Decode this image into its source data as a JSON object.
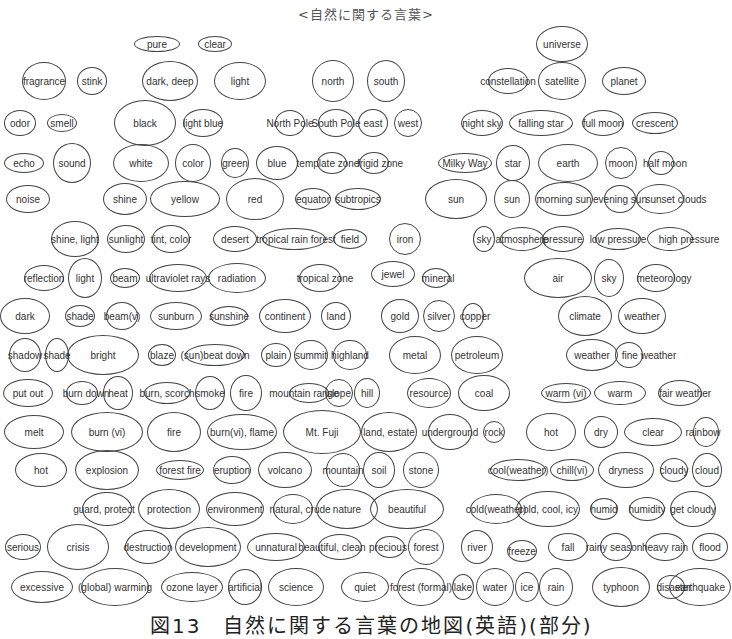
{
  "title": "<自然に関する言葉>",
  "caption": "図13　自然に関する言葉の地図(英語)(部分)",
  "nodes": [
    {
      "t": "pure",
      "x": 157,
      "y": 44,
      "w": 46,
      "h": 16
    },
    {
      "t": "clear",
      "x": 215,
      "y": 44,
      "w": 34,
      "h": 16
    },
    {
      "t": "universe",
      "x": 562,
      "y": 44,
      "w": 52,
      "h": 36
    },
    {
      "t": "fragrance",
      "x": 44,
      "y": 81,
      "w": 44,
      "h": 38
    },
    {
      "t": "stink",
      "x": 92,
      "y": 81,
      "w": 30,
      "h": 28
    },
    {
      "t": "dark, deep",
      "x": 170,
      "y": 81,
      "w": 56,
      "h": 40
    },
    {
      "t": "light",
      "x": 240,
      "y": 81,
      "w": 52,
      "h": 38
    },
    {
      "t": "north",
      "x": 333,
      "y": 81,
      "w": 42,
      "h": 42
    },
    {
      "t": "south",
      "x": 386,
      "y": 81,
      "w": 38,
      "h": 42
    },
    {
      "t": "constellation",
      "x": 508,
      "y": 81,
      "w": 40,
      "h": 26
    },
    {
      "t": "satellite",
      "x": 562,
      "y": 81,
      "w": 48,
      "h": 38
    },
    {
      "t": "planet",
      "x": 624,
      "y": 81,
      "w": 44,
      "h": 28
    },
    {
      "t": "odor",
      "x": 20,
      "y": 123,
      "w": 32,
      "h": 26
    },
    {
      "t": "smell",
      "x": 62,
      "y": 123,
      "w": 30,
      "h": 18
    },
    {
      "t": "black",
      "x": 145,
      "y": 123,
      "w": 62,
      "h": 46
    },
    {
      "t": "light blue",
      "x": 203,
      "y": 123,
      "w": 40,
      "h": 28
    },
    {
      "t": "North Pole",
      "x": 290,
      "y": 123,
      "w": 30,
      "h": 26
    },
    {
      "t": "South Pole",
      "x": 336,
      "y": 123,
      "w": 36,
      "h": 28
    },
    {
      "t": "east",
      "x": 373,
      "y": 123,
      "w": 30,
      "h": 28
    },
    {
      "t": "west",
      "x": 408,
      "y": 123,
      "w": 28,
      "h": 28
    },
    {
      "t": "night sky",
      "x": 482,
      "y": 123,
      "w": 42,
      "h": 26
    },
    {
      "t": "falling star",
      "x": 541,
      "y": 123,
      "w": 64,
      "h": 26
    },
    {
      "t": "full moon",
      "x": 603,
      "y": 123,
      "w": 42,
      "h": 26
    },
    {
      "t": "crescent",
      "x": 655,
      "y": 123,
      "w": 46,
      "h": 22
    },
    {
      "t": "echo",
      "x": 24,
      "y": 163,
      "w": 40,
      "h": 20
    },
    {
      "t": "sound",
      "x": 72,
      "y": 163,
      "w": 38,
      "h": 40
    },
    {
      "t": "white",
      "x": 141,
      "y": 163,
      "w": 56,
      "h": 38
    },
    {
      "t": "color",
      "x": 193,
      "y": 163,
      "w": 36,
      "h": 38
    },
    {
      "t": "green",
      "x": 235,
      "y": 163,
      "w": 28,
      "h": 30
    },
    {
      "t": "blue",
      "x": 277,
      "y": 163,
      "w": 42,
      "h": 34
    },
    {
      "t": "template zone",
      "x": 332,
      "y": 163,
      "w": 30,
      "h": 22,
      "lbl": [
        328,
        163
      ]
    },
    {
      "t": "frigid zone",
      "x": 374,
      "y": 163,
      "w": 30,
      "h": 22,
      "lbl": [
        380,
        163
      ]
    },
    {
      "t": "Milky Way",
      "x": 465,
      "y": 163,
      "w": 54,
      "h": 20
    },
    {
      "t": "star",
      "x": 513,
      "y": 163,
      "w": 34,
      "h": 36
    },
    {
      "t": "earth",
      "x": 568,
      "y": 163,
      "w": 60,
      "h": 38
    },
    {
      "t": "moon",
      "x": 621,
      "y": 163,
      "w": 32,
      "h": 32
    },
    {
      "t": "half moon",
      "x": 661,
      "y": 163,
      "w": 26,
      "h": 24,
      "lbl": [
        665,
        163
      ]
    },
    {
      "t": "noise",
      "x": 28,
      "y": 199,
      "w": 44,
      "h": 28
    },
    {
      "t": "shine",
      "x": 125,
      "y": 199,
      "w": 44,
      "h": 32
    },
    {
      "t": "yellow",
      "x": 185,
      "y": 199,
      "w": 70,
      "h": 36
    },
    {
      "t": "red",
      "x": 255,
      "y": 199,
      "w": 58,
      "h": 42
    },
    {
      "t": "equator",
      "x": 313,
      "y": 199,
      "w": 36,
      "h": 22
    },
    {
      "t": "subtropics",
      "x": 358,
      "y": 199,
      "w": 46,
      "h": 22
    },
    {
      "t": "sun",
      "x": 456,
      "y": 199,
      "w": 62,
      "h": 40
    },
    {
      "t": "sun",
      "x": 512,
      "y": 199,
      "w": 36,
      "h": 38
    },
    {
      "t": "morning sun",
      "x": 564,
      "y": 199,
      "w": 58,
      "h": 34
    },
    {
      "t": "evening sun",
      "x": 620,
      "y": 199,
      "w": 32,
      "h": 28,
      "lbl": [
        620,
        199
      ]
    },
    {
      "t": "sunset clouds",
      "x": 660,
      "y": 199,
      "w": 48,
      "h": 30,
      "lbl": [
        676,
        199
      ]
    },
    {
      "t": "shine, light",
      "x": 75,
      "y": 239,
      "w": 48,
      "h": 36
    },
    {
      "t": "sunlight",
      "x": 126,
      "y": 239,
      "w": 38,
      "h": 28
    },
    {
      "t": "tint, color",
      "x": 171,
      "y": 239,
      "w": 38,
      "h": 28
    },
    {
      "t": "desert",
      "x": 235,
      "y": 239,
      "w": 44,
      "h": 26
    },
    {
      "t": "tropical rain forest",
      "x": 294,
      "y": 239,
      "w": 64,
      "h": 22,
      "lbl": [
        296,
        239
      ]
    },
    {
      "t": "field",
      "x": 350,
      "y": 239,
      "w": 34,
      "h": 20
    },
    {
      "t": "iron",
      "x": 405,
      "y": 239,
      "w": 32,
      "h": 32
    },
    {
      "t": "sky",
      "x": 484,
      "y": 239,
      "w": 22,
      "h": 26
    },
    {
      "t": "atmosphere",
      "x": 522,
      "y": 239,
      "w": 44,
      "h": 24
    },
    {
      "t": "pressure",
      "x": 563,
      "y": 239,
      "w": 42,
      "h": 26
    },
    {
      "t": "low pressure",
      "x": 618,
      "y": 239,
      "w": 46,
      "h": 22
    },
    {
      "t": "high pressure",
      "x": 670,
      "y": 239,
      "w": 46,
      "h": 24,
      "lbl": [
        689,
        239
      ]
    },
    {
      "t": "reflection",
      "x": 44,
      "y": 278,
      "w": 40,
      "h": 26
    },
    {
      "t": "light",
      "x": 85,
      "y": 278,
      "w": 34,
      "h": 40
    },
    {
      "t": "beam",
      "x": 125,
      "y": 278,
      "w": 30,
      "h": 20
    },
    {
      "t": "ultraviolet rays",
      "x": 178,
      "y": 278,
      "w": 58,
      "h": 28,
      "lbl": [
        178,
        278
      ]
    },
    {
      "t": "radiation",
      "x": 237,
      "y": 278,
      "w": 58,
      "h": 30
    },
    {
      "t": "tropical zone",
      "x": 320,
      "y": 278,
      "w": 42,
      "h": 28,
      "lbl": [
        325,
        278
      ]
    },
    {
      "t": "jewel",
      "x": 393,
      "y": 274,
      "w": 44,
      "h": 26
    },
    {
      "t": "mineral",
      "x": 436,
      "y": 278,
      "w": 28,
      "h": 20,
      "lbl": [
        438,
        278
      ]
    },
    {
      "t": "air",
      "x": 558,
      "y": 278,
      "w": 68,
      "h": 40
    },
    {
      "t": "sky",
      "x": 609,
      "y": 278,
      "w": 30,
      "h": 38
    },
    {
      "t": "meteorology",
      "x": 656,
      "y": 278,
      "w": 38,
      "h": 28,
      "lbl": [
        664,
        278
      ]
    },
    {
      "t": "dark",
      "x": 25,
      "y": 316,
      "w": 50,
      "h": 36
    },
    {
      "t": "shade",
      "x": 80,
      "y": 316,
      "w": 30,
      "h": 22
    },
    {
      "t": "beam(v)",
      "x": 122,
      "y": 316,
      "w": 32,
      "h": 28
    },
    {
      "t": "sunburn",
      "x": 176,
      "y": 316,
      "w": 52,
      "h": 28
    },
    {
      "t": "sunshine",
      "x": 229,
      "y": 316,
      "w": 38,
      "h": 20
    },
    {
      "t": "continent",
      "x": 285,
      "y": 316,
      "w": 52,
      "h": 34
    },
    {
      "t": "land",
      "x": 336,
      "y": 316,
      "w": 30,
      "h": 28
    },
    {
      "t": "gold",
      "x": 400,
      "y": 316,
      "w": 38,
      "h": 34
    },
    {
      "t": "silver",
      "x": 439,
      "y": 316,
      "w": 32,
      "h": 32
    },
    {
      "t": "copper",
      "x": 473,
      "y": 316,
      "w": 22,
      "h": 26,
      "lbl": [
        475,
        316
      ]
    },
    {
      "t": "climate",
      "x": 585,
      "y": 316,
      "w": 54,
      "h": 40
    },
    {
      "t": "weather",
      "x": 642,
      "y": 316,
      "w": 48,
      "h": 36
    },
    {
      "t": "shadow",
      "x": 25,
      "y": 355,
      "w": 32,
      "h": 34
    },
    {
      "t": "shade",
      "x": 57,
      "y": 355,
      "w": 24,
      "h": 34
    },
    {
      "t": "bright",
      "x": 103,
      "y": 355,
      "w": 72,
      "h": 40
    },
    {
      "t": "blaze",
      "x": 162,
      "y": 355,
      "w": 28,
      "h": 22
    },
    {
      "t": "(sun)beat down",
      "x": 215,
      "y": 355,
      "w": 60,
      "h": 22
    },
    {
      "t": "plain",
      "x": 276,
      "y": 355,
      "w": 30,
      "h": 24
    },
    {
      "t": "summit",
      "x": 311,
      "y": 355,
      "w": 34,
      "h": 30
    },
    {
      "t": "highland",
      "x": 350,
      "y": 355,
      "w": 34,
      "h": 30
    },
    {
      "t": "metal",
      "x": 415,
      "y": 355,
      "w": 52,
      "h": 38
    },
    {
      "t": "petroleum",
      "x": 477,
      "y": 355,
      "w": 52,
      "h": 38
    },
    {
      "t": "weather",
      "x": 592,
      "y": 355,
      "w": 52,
      "h": 32
    },
    {
      "t": "fine weather",
      "x": 629,
      "y": 355,
      "w": 28,
      "h": 26,
      "lbl": [
        649,
        355
      ]
    },
    {
      "t": "put out",
      "x": 28,
      "y": 393,
      "w": 50,
      "h": 28
    },
    {
      "t": "burn down",
      "x": 82,
      "y": 393,
      "w": 32,
      "h": 24,
      "lbl": [
        86,
        393
      ]
    },
    {
      "t": "heat",
      "x": 118,
      "y": 393,
      "w": 30,
      "h": 34
    },
    {
      "t": "burn, scorch",
      "x": 167,
      "y": 393,
      "w": 46,
      "h": 22
    },
    {
      "t": "smoke",
      "x": 210,
      "y": 393,
      "w": 30,
      "h": 34
    },
    {
      "t": "fire",
      "x": 246,
      "y": 393,
      "w": 32,
      "h": 36
    },
    {
      "t": "mountain range",
      "x": 309,
      "y": 393,
      "w": 40,
      "h": 20,
      "lbl": [
        304,
        393
      ]
    },
    {
      "t": "slope",
      "x": 339,
      "y": 393,
      "w": 28,
      "h": 28
    },
    {
      "t": "hill",
      "x": 367,
      "y": 393,
      "w": 26,
      "h": 30
    },
    {
      "t": "resource",
      "x": 429,
      "y": 393,
      "w": 44,
      "h": 30
    },
    {
      "t": "coal",
      "x": 484,
      "y": 393,
      "w": 52,
      "h": 36
    },
    {
      "t": "warm (vi)",
      "x": 566,
      "y": 393,
      "w": 50,
      "h": 20
    },
    {
      "t": "warm",
      "x": 620,
      "y": 393,
      "w": 52,
      "h": 24
    },
    {
      "t": "fair weather",
      "x": 680,
      "y": 393,
      "w": 44,
      "h": 26,
      "lbl": [
        685,
        393
      ]
    },
    {
      "t": "melt",
      "x": 34,
      "y": 432,
      "w": 60,
      "h": 34
    },
    {
      "t": "burn (vi)",
      "x": 107,
      "y": 432,
      "w": 72,
      "h": 40
    },
    {
      "t": "fire",
      "x": 174,
      "y": 432,
      "w": 54,
      "h": 40
    },
    {
      "t": "burn(vi), flame",
      "x": 242,
      "y": 432,
      "w": 70,
      "h": 36
    },
    {
      "t": "Mt. Fuji",
      "x": 322,
      "y": 432,
      "w": 78,
      "h": 44
    },
    {
      "t": "land, estate",
      "x": 389,
      "y": 432,
      "w": 56,
      "h": 40
    },
    {
      "t": "underground",
      "x": 450,
      "y": 432,
      "w": 44,
      "h": 36
    },
    {
      "t": "rock",
      "x": 494,
      "y": 432,
      "w": 22,
      "h": 22
    },
    {
      "t": "hot",
      "x": 551,
      "y": 432,
      "w": 50,
      "h": 38
    },
    {
      "t": "dry",
      "x": 601,
      "y": 432,
      "w": 34,
      "h": 32
    },
    {
      "t": "clear",
      "x": 653,
      "y": 432,
      "w": 58,
      "h": 28
    },
    {
      "t": "rainbow",
      "x": 706,
      "y": 432,
      "w": 26,
      "h": 30,
      "lbl": [
        703,
        432
      ]
    },
    {
      "t": "hot",
      "x": 41,
      "y": 470,
      "w": 52,
      "h": 34
    },
    {
      "t": "explosion",
      "x": 107,
      "y": 470,
      "w": 64,
      "h": 40
    },
    {
      "t": "forest fire",
      "x": 180,
      "y": 470,
      "w": 48,
      "h": 20
    },
    {
      "t": "eruption",
      "x": 232,
      "y": 470,
      "w": 38,
      "h": 28
    },
    {
      "t": "volcano",
      "x": 285,
      "y": 470,
      "w": 54,
      "h": 36
    },
    {
      "t": "mountain",
      "x": 343,
      "y": 470,
      "w": 34,
      "h": 34
    },
    {
      "t": "soil",
      "x": 379,
      "y": 470,
      "w": 32,
      "h": 36
    },
    {
      "t": "stone",
      "x": 421,
      "y": 470,
      "w": 36,
      "h": 36
    },
    {
      "t": "cool(weather)",
      "x": 518,
      "y": 470,
      "w": 56,
      "h": 22
    },
    {
      "t": "chill(vi)",
      "x": 572,
      "y": 470,
      "w": 44,
      "h": 22
    },
    {
      "t": "dryness",
      "x": 626,
      "y": 470,
      "w": 56,
      "h": 36
    },
    {
      "t": "cloudy",
      "x": 674,
      "y": 470,
      "w": 28,
      "h": 24
    },
    {
      "t": "cloud",
      "x": 707,
      "y": 470,
      "w": 30,
      "h": 34
    },
    {
      "t": "guard, protect",
      "x": 107,
      "y": 509,
      "w": 50,
      "h": 34,
      "lbl": [
        104,
        509
      ]
    },
    {
      "t": "protection",
      "x": 169,
      "y": 509,
      "w": 62,
      "h": 40
    },
    {
      "t": "environment",
      "x": 235,
      "y": 509,
      "w": 58,
      "h": 34
    },
    {
      "t": "natural, crude",
      "x": 293,
      "y": 509,
      "w": 40,
      "h": 30,
      "lbl": [
        300,
        509
      ]
    },
    {
      "t": "nature",
      "x": 347,
      "y": 509,
      "w": 62,
      "h": 40
    },
    {
      "t": "beautiful",
      "x": 407,
      "y": 509,
      "w": 74,
      "h": 40
    },
    {
      "t": "cold(weather)",
      "x": 496,
      "y": 509,
      "w": 52,
      "h": 30
    },
    {
      "t": "cold, cool, icy",
      "x": 548,
      "y": 509,
      "w": 64,
      "h": 36
    },
    {
      "t": "humid",
      "x": 604,
      "y": 509,
      "w": 28,
      "h": 22
    },
    {
      "t": "humidity",
      "x": 647,
      "y": 509,
      "w": 36,
      "h": 24
    },
    {
      "t": "get cloudy",
      "x": 693,
      "y": 509,
      "w": 46,
      "h": 36
    },
    {
      "t": "serious",
      "x": 23,
      "y": 547,
      "w": 36,
      "h": 26
    },
    {
      "t": "crisis",
      "x": 78,
      "y": 547,
      "w": 62,
      "h": 46
    },
    {
      "t": "destruction",
      "x": 148,
      "y": 547,
      "w": 46,
      "h": 34
    },
    {
      "t": "development",
      "x": 208,
      "y": 547,
      "w": 66,
      "h": 40
    },
    {
      "t": "unnatural",
      "x": 276,
      "y": 547,
      "w": 58,
      "h": 28
    },
    {
      "t": "beautiful, clean",
      "x": 340,
      "y": 547,
      "w": 44,
      "h": 26,
      "lbl": [
        332,
        547
      ]
    },
    {
      "t": "precious",
      "x": 390,
      "y": 547,
      "w": 30,
      "h": 22,
      "lbl": [
        388,
        547
      ]
    },
    {
      "t": "forest",
      "x": 426,
      "y": 547,
      "w": 36,
      "h": 36
    },
    {
      "t": "river",
      "x": 477,
      "y": 547,
      "w": 32,
      "h": 34
    },
    {
      "t": "freeze",
      "x": 522,
      "y": 551,
      "w": 30,
      "h": 22
    },
    {
      "t": "fall",
      "x": 568,
      "y": 547,
      "w": 40,
      "h": 28
    },
    {
      "t": "rainy season",
      "x": 616,
      "y": 547,
      "w": 32,
      "h": 28,
      "lbl": [
        614,
        547
      ]
    },
    {
      "t": "heavy rain",
      "x": 665,
      "y": 547,
      "w": 40,
      "h": 28
    },
    {
      "t": "flood",
      "x": 710,
      "y": 547,
      "w": 36,
      "h": 28
    },
    {
      "t": "excessive",
      "x": 42,
      "y": 587,
      "w": 62,
      "h": 32
    },
    {
      "t": "(global) warming",
      "x": 115,
      "y": 587,
      "w": 68,
      "h": 38
    },
    {
      "t": "ozone layer",
      "x": 192,
      "y": 587,
      "w": 62,
      "h": 30
    },
    {
      "t": "artificial",
      "x": 245,
      "y": 587,
      "w": 34,
      "h": 36
    },
    {
      "t": "science",
      "x": 296,
      "y": 587,
      "w": 56,
      "h": 38
    },
    {
      "t": "quiet",
      "x": 365,
      "y": 587,
      "w": 48,
      "h": 30
    },
    {
      "t": "forest (formal)",
      "x": 421,
      "y": 587,
      "w": 48,
      "h": 38
    },
    {
      "t": "lake",
      "x": 463,
      "y": 587,
      "w": 22,
      "h": 26
    },
    {
      "t": "water",
      "x": 495,
      "y": 587,
      "w": 38,
      "h": 38
    },
    {
      "t": "ice",
      "x": 527,
      "y": 587,
      "w": 24,
      "h": 30
    },
    {
      "t": "rain",
      "x": 556,
      "y": 587,
      "w": 34,
      "h": 38
    },
    {
      "t": "typhoon",
      "x": 621,
      "y": 587,
      "w": 58,
      "h": 40
    },
    {
      "t": "disaster",
      "x": 671,
      "y": 587,
      "w": 28,
      "h": 24,
      "lbl": [
        674,
        587
      ]
    },
    {
      "t": "earthquake",
      "x": 700,
      "y": 587,
      "w": 62,
      "h": 38
    }
  ],
  "styles": {
    "stroke_color": "#444444",
    "text_color": "#333333",
    "background": "#ffffff"
  }
}
